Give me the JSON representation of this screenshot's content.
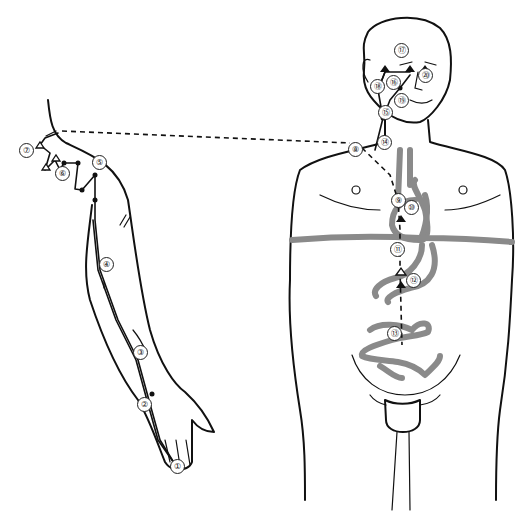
{
  "diagram": {
    "colors": {
      "line": "#111111",
      "organ": "#8a8a8a",
      "background": "#ffffff"
    },
    "points": [
      {
        "id": "1",
        "label": "①",
        "x": 176,
        "y": 466
      },
      {
        "id": "2",
        "label": "②",
        "x": 143,
        "y": 404
      },
      {
        "id": "3",
        "label": "③",
        "x": 139,
        "y": 352
      },
      {
        "id": "4",
        "label": "④",
        "x": 105,
        "y": 264
      },
      {
        "id": "5",
        "label": "⑤",
        "x": 98,
        "y": 162
      },
      {
        "id": "6",
        "label": "⑥",
        "x": 61,
        "y": 173
      },
      {
        "id": "7",
        "label": "⑦",
        "x": 25,
        "y": 150
      },
      {
        "id": "8",
        "label": "⑧",
        "x": 354,
        "y": 149
      },
      {
        "id": "9",
        "label": "⑨",
        "x": 397,
        "y": 200
      },
      {
        "id": "10",
        "label": "⑩",
        "x": 410,
        "y": 207
      },
      {
        "id": "11",
        "label": "⑪",
        "x": 396,
        "y": 249
      },
      {
        "id": "12",
        "label": "⑫",
        "x": 412,
        "y": 280
      },
      {
        "id": "13",
        "label": "⑬",
        "x": 393,
        "y": 333
      },
      {
        "id": "14",
        "label": "⑭",
        "x": 383,
        "y": 142
      },
      {
        "id": "15",
        "label": "⑮",
        "x": 384,
        "y": 112
      },
      {
        "id": "16",
        "label": "⑯",
        "x": 392,
        "y": 82
      },
      {
        "id": "17",
        "label": "⑰",
        "x": 400,
        "y": 50
      },
      {
        "id": "18",
        "label": "⑱",
        "x": 376,
        "y": 86
      },
      {
        "id": "19",
        "label": "⑲",
        "x": 400,
        "y": 100
      },
      {
        "id": "20",
        "label": "⑳",
        "x": 424,
        "y": 75
      }
    ]
  }
}
